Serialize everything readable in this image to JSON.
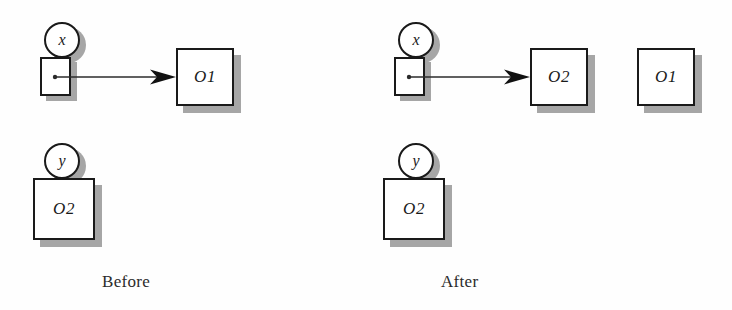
{
  "figure": {
    "type": "object-reference-diagram",
    "background_color": "#fefefe",
    "stroke_color": "#1a1a1a",
    "shadow_color": "#a6a6a6",
    "panels": [
      {
        "id": "before",
        "caption": "Before",
        "caption_x": 102,
        "caption_y": 272,
        "variables": [
          {
            "name": "x",
            "circle": {
              "x": 44,
              "y": 22,
              "d": 36
            },
            "slot": {
              "x": 40,
              "y": 57,
              "w": 31,
              "h": 39
            },
            "points_to": "o1-before",
            "arrow": {
              "x1": 55,
              "y1": 77,
              "x2": 176,
              "y2": 77
            }
          },
          {
            "name": "y",
            "circle": {
              "x": 44,
              "y": 143,
              "d": 36
            },
            "slot": null,
            "points_to": null,
            "arrow": null
          }
        ],
        "objects": [
          {
            "id": "o1-before",
            "label": "O1",
            "x": 176,
            "y": 48,
            "w": 58,
            "h": 58
          },
          {
            "id": "o2-before",
            "label": "O2",
            "x": 33,
            "y": 178,
            "w": 62,
            "h": 62
          }
        ]
      },
      {
        "id": "after",
        "caption": "After",
        "caption_x": 441,
        "caption_y": 272,
        "variables": [
          {
            "name": "x",
            "circle": {
              "x": 398,
              "y": 22,
              "d": 36
            },
            "slot": {
              "x": 394,
              "y": 57,
              "w": 31,
              "h": 39
            },
            "points_to": "o2-after",
            "arrow": {
              "x1": 409,
              "y1": 77,
              "x2": 530,
              "y2": 77
            }
          },
          {
            "name": "y",
            "circle": {
              "x": 398,
              "y": 143,
              "d": 36
            },
            "slot": null,
            "points_to": null,
            "arrow": null
          }
        ],
        "objects": [
          {
            "id": "o2-after",
            "label": "O2",
            "x": 530,
            "y": 48,
            "w": 58,
            "h": 58
          },
          {
            "id": "o1-after",
            "label": "O1",
            "x": 637,
            "y": 48,
            "w": 58,
            "h": 58
          },
          {
            "id": "o2-y-after",
            "label": "O2",
            "x": 383,
            "y": 178,
            "w": 62,
            "h": 62
          }
        ]
      }
    ]
  }
}
